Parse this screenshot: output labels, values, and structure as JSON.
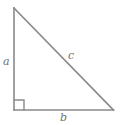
{
  "figure": {
    "kind": "right-triangle-diagram",
    "background_color": "#ffffff",
    "stroke_color": "#8a8a8a",
    "label_color": "#6f6f6f",
    "stroke_width": 1.6,
    "width": 120,
    "height": 125
  },
  "labels": {
    "leg_vertical": "a",
    "leg_horizontal": "b",
    "hypotenuse": "c"
  },
  "geometry": {
    "apex": {
      "x": 14,
      "y": 8
    },
    "right_angle_vertex": {
      "x": 14,
      "y": 110
    },
    "base_right_vertex": {
      "x": 113,
      "y": 110
    },
    "right_angle_marker": {
      "x": 14,
      "y": 100,
      "size": 10
    },
    "polyline_points": "14,8 14,110 113,110 14,8"
  }
}
